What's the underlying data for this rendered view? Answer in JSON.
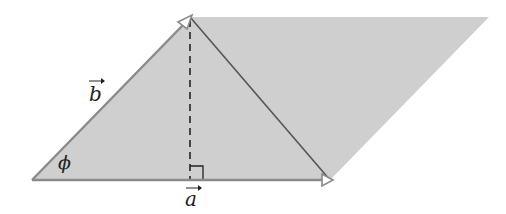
{
  "diagram": {
    "type": "vector-parallelogram",
    "labels": {
      "vector_a": "a",
      "vector_b": "b",
      "angle": "ϕ"
    },
    "colors": {
      "fill": "#cfcfcf",
      "vector_stroke": "#8a8a8a",
      "diagonal_stroke": "#555555",
      "dashed_height": "#222222",
      "text": "#222222"
    },
    "points": {
      "origin": [
        32,
        180
      ],
      "tip_a": [
        330,
        180
      ],
      "tip_b": [
        190,
        17
      ],
      "far_corner": [
        489,
        17
      ],
      "foot_of_height": [
        190,
        180
      ]
    },
    "annotations": [
      "right-angle marker at foot of height",
      "dashed height from tip of b to a"
    ]
  }
}
